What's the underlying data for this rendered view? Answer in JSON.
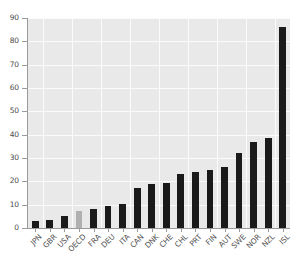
{
  "chart_data": {
    "type": "bar",
    "title": "",
    "subtitle": "",
    "xlabel": "",
    "ylabel": "",
    "categories": [
      "JPN",
      "GBR",
      "USA",
      "OECD",
      "FRA",
      "DEU",
      "ITA",
      "CAN",
      "DNK",
      "CHE",
      "CHL",
      "PRT",
      "FIN",
      "AUT",
      "SWE",
      "NOR",
      "NZL",
      "ISL"
    ],
    "values": [
      3,
      3.5,
      5,
      7.5,
      8,
      9.5,
      10.5,
      17,
      19,
      19.5,
      23,
      24,
      25,
      26,
      32,
      37,
      38.5,
      86
    ],
    "highlight_category": "OECD",
    "ylim": [
      0,
      90
    ],
    "yticks": [
      0,
      10,
      20,
      30,
      40,
      50,
      60,
      70,
      80,
      90
    ],
    "ytick_labels": [
      "0",
      "10",
      "20",
      "30",
      "40",
      "50",
      "60",
      "70",
      "80",
      "90"
    ],
    "grid": true,
    "legend": "none",
    "legend_position": "none",
    "annotations": [],
    "series": [
      {
        "name": "value",
        "values": [
          3,
          3.5,
          5,
          7.5,
          8,
          9.5,
          10.5,
          17,
          19,
          19.5,
          23,
          24,
          25,
          26,
          32,
          37,
          38.5,
          86
        ]
      }
    ]
  },
  "style": {
    "bar_color": "#1a1a1a",
    "highlight_bar_color": "#b0b0b0",
    "plot_background": "#e9e9e9",
    "grid_color": "#fbfbfb",
    "axis_color": "#9a9a9a",
    "tick_label_color": "#4d4d4d",
    "figure_background": "#ffffff"
  }
}
